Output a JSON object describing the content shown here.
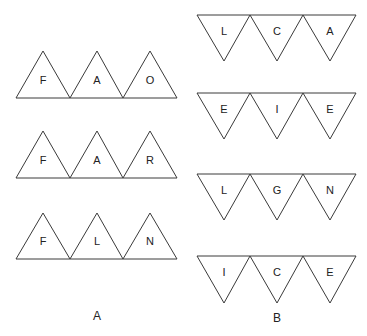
{
  "diagram": {
    "stroke_color": "#3a3a3a",
    "background": "#ffffff",
    "groups": [
      {
        "label": "A",
        "orientation": "up",
        "rows": [
          {
            "letters": [
              "F",
              "A",
              "O"
            ]
          },
          {
            "letters": [
              "F",
              "A",
              "R"
            ]
          },
          {
            "letters": [
              "F",
              "L",
              "N"
            ]
          }
        ]
      },
      {
        "label": "B",
        "orientation": "down",
        "rows": [
          {
            "letters": [
              "L",
              "C",
              "A"
            ]
          },
          {
            "letters": [
              "E",
              "I",
              "E"
            ]
          },
          {
            "letters": [
              "L",
              "G",
              "N"
            ]
          },
          {
            "letters": [
              "I",
              "C",
              "E"
            ]
          }
        ]
      }
    ]
  }
}
